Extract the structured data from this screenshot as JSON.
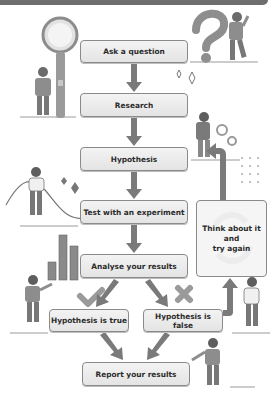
{
  "diagram": {
    "title_bar": "",
    "steps": [
      {
        "id": "ask",
        "label": "Ask a question"
      },
      {
        "id": "research",
        "label": "Research"
      },
      {
        "id": "hypothesis",
        "label": "Hypothesis"
      },
      {
        "id": "test",
        "label": "Test with an experiment"
      },
      {
        "id": "analyse",
        "label": "Analyse your results"
      },
      {
        "id": "true",
        "label": "Hypothesis is true"
      },
      {
        "id": "false",
        "label": "Hypothesis is false"
      },
      {
        "id": "report",
        "label": "Report your results"
      }
    ],
    "loop_box": {
      "line1": "Think about it",
      "line2": "and",
      "line3": "try again"
    },
    "icons": [
      "magnifying-glass-icon",
      "question-mark-icon",
      "sparkle-icon",
      "gears-icon",
      "dots-grid-icon",
      "wave-icon",
      "bar-chart-icon",
      "check-mark-icon",
      "cross-mark-icon",
      "refresh-cycle-icon"
    ],
    "colors": {
      "box_fill": "#ececec",
      "box_border": "#8a8a8a",
      "arrow": "#7a7a7a",
      "bar": "#6e6e6e"
    }
  }
}
